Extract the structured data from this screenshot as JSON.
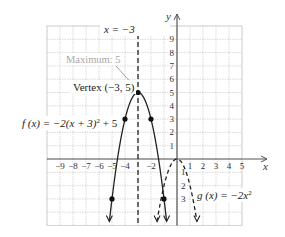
{
  "chart_data": {
    "type": "line",
    "title": "",
    "xlabel": "x",
    "ylabel": "y",
    "xlim": [
      -10,
      6
    ],
    "ylim": [
      -5,
      10
    ],
    "grid": true,
    "x_ticks": [
      -9,
      -8,
      -7,
      -6,
      -5,
      -4,
      -2,
      1,
      2,
      3,
      4,
      5
    ],
    "x_tick_labels": [
      "−9",
      "−8",
      "−7",
      "−6",
      "−5",
      "−4",
      "−2",
      "1",
      "2",
      "3",
      "4",
      "5"
    ],
    "y_ticks": [
      9,
      8,
      7,
      6,
      5,
      4,
      3,
      2,
      1,
      -1,
      -2,
      -3
    ],
    "y_tick_labels": [
      "9",
      "8",
      "7",
      "6",
      "5",
      "4",
      "3",
      "2",
      "1",
      "1",
      "2",
      "3"
    ],
    "series": [
      {
        "name": "f(x) = −2(x + 3)² + 5",
        "style": "solid",
        "formula": "-2*(x+3)^2+5",
        "points": [
          [
            -3,
            5
          ],
          [
            -4,
            3
          ],
          [
            -2,
            3
          ],
          [
            -5,
            -3
          ],
          [
            -1,
            -3
          ]
        ]
      },
      {
        "name": "g(x) = −2x²",
        "style": "dashed",
        "formula": "-2*x^2",
        "points": [
          [
            0,
            0
          ]
        ]
      }
    ],
    "asymptote_lines": [
      {
        "name": "x = −3",
        "x": -3,
        "style": "dashed"
      }
    ],
    "annotations": [
      {
        "text": "x = −3",
        "at": [
          -3,
          9.5
        ]
      },
      {
        "text": "Maximum: 5",
        "at": [
          -3,
          5
        ],
        "color": "#a0a0a0"
      },
      {
        "text": "Vertex (−3, 5)",
        "at": [
          -3,
          5
        ]
      },
      {
        "text": "f(x) = −2(x + 3)² + 5",
        "at": [
          -5,
          3
        ]
      },
      {
        "text": "g(x) = −2x²",
        "at": [
          1.5,
          -2.5
        ]
      }
    ]
  },
  "labels": {
    "x_axis": "x",
    "y_axis": "y",
    "asymptote": "x = −3",
    "maximum": "Maximum: 5",
    "vertex": "Vertex (−3, 5)",
    "f_label_pre": "f (x) = −2(x + 3)",
    "f_label_post": " + 5",
    "g_label_pre": "g (x) = −2x",
    "sup2": "2"
  },
  "colors": {
    "grid": "#cfcfcf",
    "axis": "#555555",
    "curve": "#222222",
    "annotation_gray": "#a8a8a8"
  }
}
